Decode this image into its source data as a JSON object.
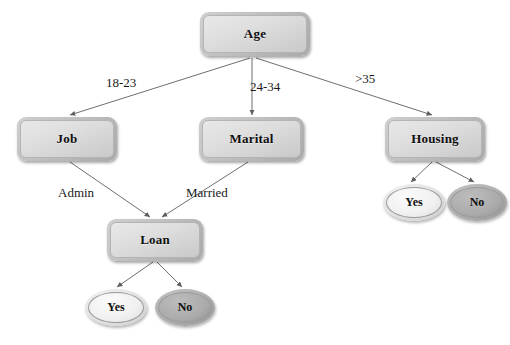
{
  "diagram": {
    "type": "decision-tree",
    "title": "",
    "nodes": [
      {
        "id": "age",
        "label": "Age",
        "shape": "box",
        "x": 200,
        "y": 12,
        "w": 110,
        "h": 44
      },
      {
        "id": "job",
        "label": "Job",
        "shape": "box",
        "x": 17,
        "y": 117,
        "w": 100,
        "h": 44
      },
      {
        "id": "marital",
        "label": "Marital",
        "shape": "box",
        "x": 199,
        "y": 117,
        "w": 105,
        "h": 44
      },
      {
        "id": "housing",
        "label": "Housing",
        "shape": "box",
        "x": 385,
        "y": 117,
        "w": 100,
        "h": 44
      },
      {
        "id": "loan",
        "label": "Loan",
        "shape": "box",
        "x": 107,
        "y": 219,
        "w": 96,
        "h": 42
      },
      {
        "id": "housing_yes",
        "label": "Yes",
        "shape": "ellipse",
        "style": "light",
        "x": 383,
        "y": 184,
        "w": 62,
        "h": 37
      },
      {
        "id": "housing_no",
        "label": "No",
        "shape": "ellipse",
        "style": "dark",
        "x": 447,
        "y": 184,
        "w": 60,
        "h": 37
      },
      {
        "id": "loan_yes",
        "label": "Yes",
        "shape": "ellipse",
        "style": "light",
        "x": 85,
        "y": 289,
        "w": 62,
        "h": 37
      },
      {
        "id": "loan_no",
        "label": "No",
        "shape": "ellipse",
        "style": "dark",
        "x": 155,
        "y": 289,
        "w": 60,
        "h": 37
      }
    ],
    "edges": [
      {
        "from": "age",
        "to": "job",
        "label": "18-23",
        "label_x": 106,
        "label_y": 75
      },
      {
        "from": "age",
        "to": "marital",
        "label": "24-34",
        "label_x": 250,
        "label_y": 79
      },
      {
        "from": "age",
        "to": "housing",
        "label": ">35",
        "label_x": 355,
        "label_y": 71
      },
      {
        "from": "job",
        "to": "loan",
        "label": "Admin",
        "label_x": 58,
        "label_y": 185
      },
      {
        "from": "marital",
        "to": "loan",
        "label": "Married",
        "label_x": 186,
        "label_y": 185
      },
      {
        "from": "housing",
        "to": "housing_yes",
        "label": ""
      },
      {
        "from": "housing",
        "to": "housing_no",
        "label": ""
      },
      {
        "from": "loan",
        "to": "loan_yes",
        "label": ""
      },
      {
        "from": "loan",
        "to": "loan_no",
        "label": ""
      }
    ],
    "colors": {
      "background": "#ffffff",
      "edge_line": "#6f6f6f",
      "box_fill": "#dedede",
      "box_border": "#9a9a9a",
      "leaf_light_fill": "#f0f0f0",
      "leaf_dark_fill": "#ababab",
      "text": "#111111"
    }
  }
}
